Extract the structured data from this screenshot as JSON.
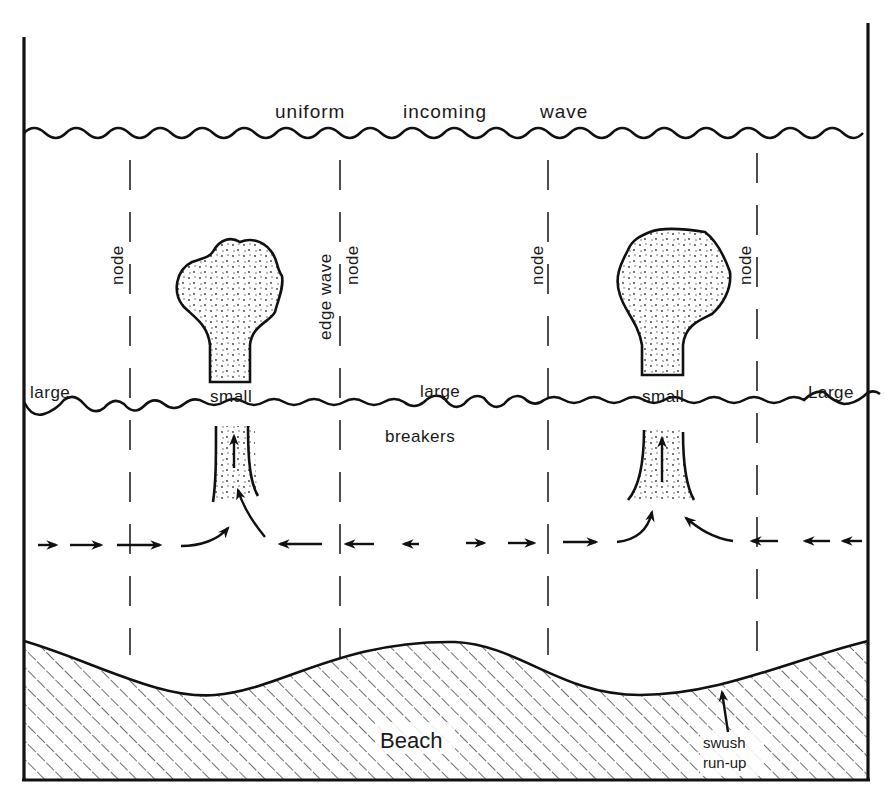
{
  "diagram": {
    "title_label": "uniform incoming wave",
    "title_words": [
      "uniform",
      "incoming",
      "wave"
    ],
    "node_labels": {
      "node_1": "node",
      "edge_wave": "edge wave",
      "node_2": "node",
      "node_3": "node",
      "node_4": "node"
    },
    "breaker_labels": {
      "left": "large",
      "rip_1": "small",
      "middle": "large",
      "rip_2": "small",
      "right": "Large",
      "breakers": "breakers"
    },
    "beach": {
      "label": "Beach",
      "swash_line_1": "swush",
      "swash_line_2": "run-up"
    },
    "node_positions_x": [
      130,
      340,
      548,
      757
    ],
    "colors": {
      "ink": "#111111",
      "background": "#ffffff"
    }
  }
}
